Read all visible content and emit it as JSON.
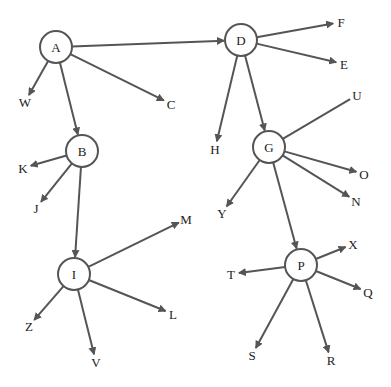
{
  "diagram": {
    "type": "tree",
    "colors": {
      "stroke": "#555555",
      "text": "#222222",
      "background": "#ffffff"
    },
    "node_radius": 16,
    "nodes": [
      {
        "id": "A",
        "label": "A",
        "x": 56,
        "y": 47,
        "kind": "internal"
      },
      {
        "id": "D",
        "label": "D",
        "x": 241,
        "y": 40,
        "kind": "internal"
      },
      {
        "id": "B",
        "label": "B",
        "x": 82,
        "y": 151,
        "kind": "internal"
      },
      {
        "id": "G",
        "label": "G",
        "x": 269,
        "y": 147,
        "kind": "internal"
      },
      {
        "id": "I",
        "label": "I",
        "x": 74,
        "y": 274,
        "kind": "internal"
      },
      {
        "id": "P",
        "label": "P",
        "x": 301,
        "y": 265,
        "kind": "internal"
      },
      {
        "id": "W",
        "label": "W",
        "x": 25,
        "y": 102,
        "kind": "leaf"
      },
      {
        "id": "C",
        "label": "C",
        "x": 171,
        "y": 104,
        "kind": "leaf"
      },
      {
        "id": "F",
        "label": "F",
        "x": 341,
        "y": 22,
        "kind": "leaf"
      },
      {
        "id": "E",
        "label": "E",
        "x": 344,
        "y": 64,
        "kind": "leaf"
      },
      {
        "id": "H",
        "label": "H",
        "x": 215,
        "y": 149,
        "kind": "leaf"
      },
      {
        "id": "U",
        "label": "U",
        "x": 357,
        "y": 95,
        "kind": "leaf"
      },
      {
        "id": "O",
        "label": "O",
        "x": 364,
        "y": 174,
        "kind": "leaf"
      },
      {
        "id": "N",
        "label": "N",
        "x": 356,
        "y": 201,
        "kind": "leaf"
      },
      {
        "id": "Y",
        "label": "Y",
        "x": 222,
        "y": 213,
        "kind": "leaf"
      },
      {
        "id": "K",
        "label": "K",
        "x": 23,
        "y": 168,
        "kind": "leaf"
      },
      {
        "id": "J",
        "label": "J",
        "x": 36,
        "y": 208,
        "kind": "leaf"
      },
      {
        "id": "M",
        "label": "M",
        "x": 186,
        "y": 219,
        "kind": "leaf"
      },
      {
        "id": "L",
        "label": "L",
        "x": 173,
        "y": 314,
        "kind": "leaf"
      },
      {
        "id": "Z",
        "label": "Z",
        "x": 29,
        "y": 326,
        "kind": "leaf"
      },
      {
        "id": "V",
        "label": "V",
        "x": 96,
        "y": 362,
        "kind": "leaf"
      },
      {
        "id": "T",
        "label": "T",
        "x": 231,
        "y": 274,
        "kind": "leaf"
      },
      {
        "id": "X",
        "label": "X",
        "x": 353,
        "y": 244,
        "kind": "leaf"
      },
      {
        "id": "Q",
        "label": "Q",
        "x": 368,
        "y": 292,
        "kind": "leaf"
      },
      {
        "id": "S",
        "label": "S",
        "x": 252,
        "y": 355,
        "kind": "leaf"
      },
      {
        "id": "R",
        "label": "R",
        "x": 331,
        "y": 360,
        "kind": "leaf"
      }
    ],
    "edges": [
      {
        "from": "A",
        "to": "D",
        "arrow": true
      },
      {
        "from": "A",
        "to": "W",
        "arrow": true
      },
      {
        "from": "A",
        "to": "C",
        "arrow": true
      },
      {
        "from": "A",
        "to": "B",
        "arrow": true
      },
      {
        "from": "D",
        "to": "F",
        "arrow": true
      },
      {
        "from": "D",
        "to": "E",
        "arrow": true
      },
      {
        "from": "D",
        "to": "H",
        "arrow": true
      },
      {
        "from": "D",
        "to": "G",
        "arrow": true
      },
      {
        "from": "B",
        "to": "K",
        "arrow": true
      },
      {
        "from": "B",
        "to": "J",
        "arrow": true
      },
      {
        "from": "B",
        "to": "I",
        "arrow": true
      },
      {
        "from": "G",
        "to": "U",
        "arrow": false
      },
      {
        "from": "G",
        "to": "O",
        "arrow": true
      },
      {
        "from": "G",
        "to": "N",
        "arrow": true
      },
      {
        "from": "G",
        "to": "Y",
        "arrow": true
      },
      {
        "from": "G",
        "to": "P",
        "arrow": true
      },
      {
        "from": "I",
        "to": "M",
        "arrow": true
      },
      {
        "from": "I",
        "to": "L",
        "arrow": true
      },
      {
        "from": "I",
        "to": "Z",
        "arrow": true
      },
      {
        "from": "I",
        "to": "V",
        "arrow": true
      },
      {
        "from": "P",
        "to": "X",
        "arrow": true
      },
      {
        "from": "P",
        "to": "T",
        "arrow": true
      },
      {
        "from": "P",
        "to": "Q",
        "arrow": true
      },
      {
        "from": "P",
        "to": "S",
        "arrow": true
      },
      {
        "from": "P",
        "to": "R",
        "arrow": true
      }
    ]
  }
}
